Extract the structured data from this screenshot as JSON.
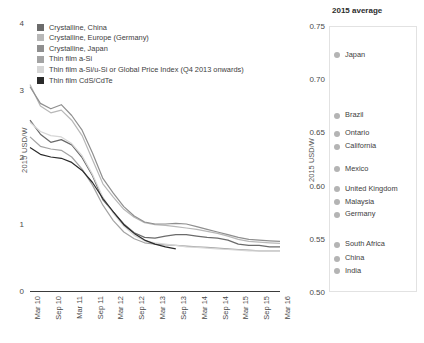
{
  "chart_data": [
    {
      "type": "line",
      "title": "",
      "xlabel": "",
      "ylabel": "2015 USD/W",
      "ylim": [
        0,
        4
      ],
      "yticks": [
        0,
        1,
        2,
        3,
        4
      ],
      "ytick_labels": [
        "0",
        "1",
        "2",
        "3",
        "4"
      ],
      "grid": false,
      "legend_position": "top-left",
      "categories": [
        "Mar 10",
        "Sep 10",
        "Mar 11",
        "Sep 11",
        "Mar 12",
        "Sep 12",
        "Mar 13",
        "Sep 13",
        "Mar 14",
        "Sep 14",
        "Mar 15",
        "Sep 15",
        "Mar 16"
      ],
      "x": [
        "Mar 10",
        "Jun 10",
        "Sep 10",
        "Dec 10",
        "Mar 11",
        "Jun 11",
        "Sep 11",
        "Dec 11",
        "Mar 12",
        "Jun 12",
        "Sep 12",
        "Dec 12",
        "Mar 13",
        "Jun 13",
        "Sep 13",
        "Dec 13",
        "Mar 14",
        "Jun 14",
        "Sep 14",
        "Dec 14",
        "Mar 15",
        "Jun 15",
        "Sep 15",
        "Dec 15",
        "Mar 16"
      ],
      "series": [
        {
          "name": "Crystalline, China",
          "color": "#6b6b6b",
          "values": [
            2.55,
            2.34,
            2.22,
            2.26,
            2.18,
            1.99,
            1.72,
            1.36,
            1.18,
            1.0,
            0.87,
            0.8,
            0.79,
            0.82,
            0.84,
            0.84,
            0.82,
            0.8,
            0.79,
            0.76,
            0.7,
            0.68,
            0.68,
            0.66,
            0.66
          ]
        },
        {
          "name": "Crystalline, Europe (Germany)",
          "color": "#b8b8b8",
          "values": [
            3.08,
            2.76,
            2.66,
            2.7,
            2.55,
            2.32,
            1.96,
            1.6,
            1.4,
            1.22,
            1.1,
            1.02,
            0.99,
            0.98,
            0.96,
            0.94,
            0.92,
            0.89,
            0.86,
            0.82,
            0.77,
            0.74,
            0.73,
            0.72,
            0.71
          ]
        },
        {
          "name": "Crystalline, Japan",
          "color": "#8f8f8f",
          "values": [
            3.05,
            2.8,
            2.72,
            2.78,
            2.62,
            2.4,
            2.06,
            1.68,
            1.46,
            1.26,
            1.12,
            1.03,
            1.0,
            1.0,
            1.01,
            1.0,
            0.96,
            0.92,
            0.88,
            0.84,
            0.8,
            0.77,
            0.76,
            0.75,
            0.74
          ]
        },
        {
          "name": "Thin film a-Si",
          "color": "#a3a3a3",
          "values": [
            2.3,
            2.16,
            2.12,
            2.1,
            2.0,
            1.82,
            1.58,
            1.28,
            1.05,
            0.88,
            0.78,
            0.72,
            0.7,
            0.69,
            0.68,
            0.67,
            0.66,
            0.65,
            0.64,
            0.63,
            0.62,
            0.61,
            0.6,
            0.6,
            0.6
          ]
        },
        {
          "name": "Thin film a-Si/u-Si or Global Price Index (Q4 2013 onwards)",
          "color": "#d6d6d6",
          "values": [
            2.52,
            2.38,
            2.32,
            2.3,
            2.2,
            2.02,
            1.74,
            1.4,
            1.16,
            0.97,
            0.83,
            0.75,
            0.72,
            0.7,
            0.68,
            0.66,
            0.65,
            0.64,
            0.63,
            0.62,
            0.61,
            0.6,
            0.6,
            0.6,
            0.6
          ]
        },
        {
          "name": "Thin film CdS/CdTe",
          "color": "#2a2a2a",
          "values": [
            2.14,
            2.04,
            2.0,
            1.98,
            1.92,
            1.8,
            1.62,
            1.38,
            1.18,
            0.99,
            0.86,
            0.76,
            0.7,
            0.66,
            0.63,
            null,
            null,
            null,
            null,
            null,
            null,
            null,
            null,
            null,
            null
          ]
        }
      ]
    },
    {
      "type": "scatter",
      "title": "2015 average",
      "ylabel": "2015 USD/W",
      "ylim": [
        0.5,
        0.75
      ],
      "yticks": [
        0.5,
        0.55,
        0.6,
        0.65,
        0.7,
        0.75
      ],
      "ytick_labels": [
        "0.50",
        "0.55",
        "0.60",
        "0.65",
        "0.70",
        "0.75"
      ],
      "grid": false,
      "dot_color": "#b4b4b4",
      "points": [
        {
          "label": "Japan",
          "value": 0.723
        },
        {
          "label": "Brazil",
          "value": 0.666
        },
        {
          "label": "Ontario",
          "value": 0.649
        },
        {
          "label": "California",
          "value": 0.637
        },
        {
          "label": "Mexico",
          "value": 0.616
        },
        {
          "label": "United Kingdom",
          "value": 0.597
        },
        {
          "label": "Malaysia",
          "value": 0.585
        },
        {
          "label": "Germany",
          "value": 0.573
        },
        {
          "label": "South Africa",
          "value": 0.545
        },
        {
          "label": "China",
          "value": 0.532
        },
        {
          "label": "India",
          "value": 0.52
        }
      ]
    }
  ]
}
